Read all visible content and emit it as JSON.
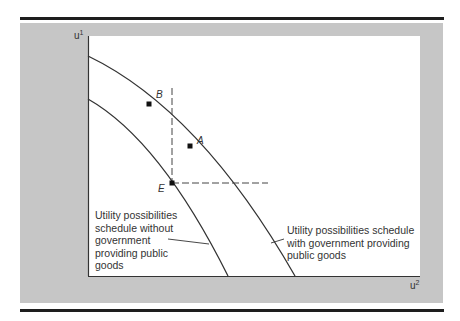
{
  "figure": {
    "axes": {
      "y_label": "u",
      "y_label_sup": "1",
      "x_label": "u",
      "x_label_sup": "2"
    },
    "points": [
      {
        "id": "B",
        "label": "B"
      },
      {
        "id": "A",
        "label": "A"
      },
      {
        "id": "E",
        "label": "E"
      }
    ],
    "curves": [
      {
        "id": "without",
        "label_lines": [
          "Utility possibilities",
          "schedule without",
          "government",
          "providing public",
          "goods"
        ]
      },
      {
        "id": "with",
        "label_lines": [
          "Utility possibilities schedule",
          "with government providing",
          "public goods"
        ]
      }
    ],
    "colors": {
      "background_panel": "#c6c6c6",
      "plot_area": "#ffffff",
      "line": "#333333",
      "rule": "#1e1e1e"
    }
  }
}
